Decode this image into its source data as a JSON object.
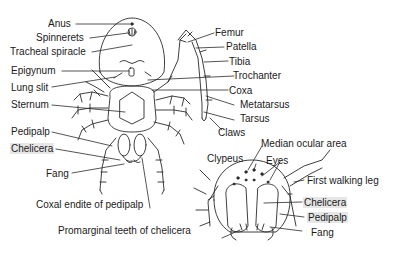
{
  "diagram": {
    "ventral_labels": {
      "anus": "Anus",
      "spinnerets": "Spinnerets",
      "tracheal_spiracle": "Tracheal spiracle",
      "epigynum": "Epigynum",
      "lung_slit": "Lung slit",
      "sternum": "Sternum",
      "pedipalp": "Pedipalp",
      "chelicera": "Chelicera",
      "fang": "Fang",
      "coxal_endite": "Coxal endite of pedipalp"
    },
    "leg_labels": {
      "femur": "Femur",
      "patella": "Patella",
      "tibia": "Tibia",
      "trochanter": "Trochanter",
      "coxa": "Coxa",
      "metatarsus": "Metatarsus",
      "tarsus": "Tarsus",
      "claws": "Claws"
    },
    "head_labels": {
      "median_ocular_area": "Median ocular area",
      "clypeus": "Clypeus",
      "eyes": "Eyes",
      "first_walking_leg": "First walking leg",
      "chelicera": "Chelicera",
      "pedipalp": "Pedipalp",
      "fang": "Fang",
      "promarginal_teeth": "Promarginal teeth of chelicera"
    },
    "colors": {
      "line": "#2a2a2a",
      "highlight": "#e6e6e6",
      "background": "#ffffff"
    }
  }
}
